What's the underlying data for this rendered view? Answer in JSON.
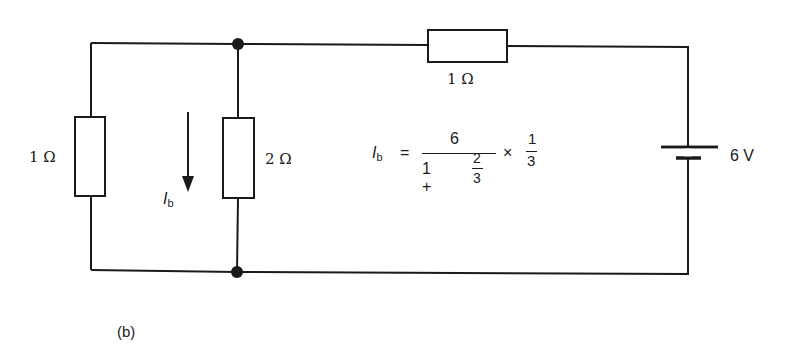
{
  "figure": {
    "caption": "(b)",
    "colors": {
      "stroke": "#1a1a1a",
      "background": "#ffffff"
    }
  },
  "components": {
    "left_resistor": {
      "label": "1 Ω"
    },
    "middle_resistor": {
      "label": "2 Ω"
    },
    "top_resistor": {
      "label": "1 Ω"
    },
    "battery": {
      "label": "6 V"
    }
  },
  "current": {
    "symbol": "I",
    "subscript": "b",
    "direction": "down"
  },
  "equation": {
    "lhs_symbol": "I",
    "lhs_subscript": "b",
    "equals": "=",
    "numerator": "6",
    "denominator_prefix": "1 +",
    "inner_numerator": "2",
    "inner_denominator": "3",
    "times": "×",
    "factor_numerator": "1",
    "factor_denominator": "3"
  }
}
